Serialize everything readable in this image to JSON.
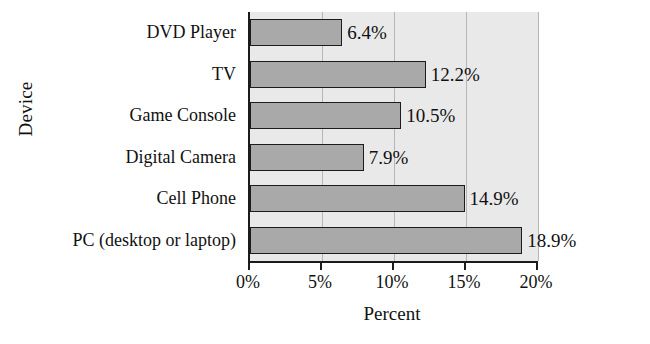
{
  "chart_data": {
    "type": "bar",
    "orientation": "horizontal",
    "title": "",
    "xlabel": "Percent",
    "ylabel": "Device",
    "categories": [
      "DVD Player",
      "TV",
      "Game Console",
      "Digital Camera",
      "Cell Phone",
      "PC (desktop or laptop)"
    ],
    "values": [
      6.4,
      12.2,
      10.5,
      7.9,
      14.9,
      18.9
    ],
    "value_labels": [
      "6.4%",
      "12.2%",
      "10.5%",
      "7.9%",
      "14.9%",
      "18.9%"
    ],
    "xlim": [
      0,
      20
    ],
    "xticks": [
      0,
      5,
      10,
      15,
      20
    ],
    "xtick_labels": [
      "0%",
      "5%",
      "10%",
      "15%",
      "20%"
    ],
    "grid": "vertical",
    "legend": "none",
    "bar_color": "#a9a9a9",
    "bar_edge_color": "#1c1c1c",
    "plot_background": "#e9e9e9",
    "axis_color": "#1b1b1b",
    "gridline_color": "#b6b6b6"
  }
}
